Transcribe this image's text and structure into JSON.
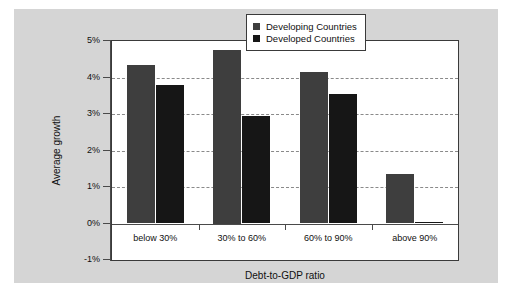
{
  "chart_data": {
    "type": "bar",
    "title": "",
    "xlabel": "Debt-to-GDP ratio",
    "ylabel": "Average growth",
    "categories": [
      "below 30%",
      "30% to 60%",
      "60% to 90%",
      "above 90%"
    ],
    "series": [
      {
        "name": "Developing Countries",
        "color": "#3e3e3e",
        "values": [
          4.35,
          4.75,
          4.15,
          1.35
        ]
      },
      {
        "name": "Developed Countries",
        "color": "#161616",
        "values": [
          3.8,
          2.95,
          3.55,
          0.05
        ]
      }
    ],
    "ylim": [
      -1,
      5
    ],
    "ytick_labels": [
      "5%",
      "4%",
      "3%",
      "2%",
      "1%",
      "0%",
      "-1%"
    ],
    "ytick_values": [
      5,
      4,
      3,
      2,
      1,
      0,
      -1
    ],
    "yunit": "%",
    "grid": "horizontal-dashed",
    "gridline_values": [
      4,
      3,
      2,
      1
    ],
    "legend_position": "top-right",
    "background_color": "#d5d5d5",
    "plot_background_color": "#ffffff"
  },
  "legend": {
    "entries": [
      {
        "label": "Developing Countries"
      },
      {
        "label": "Developed Countries"
      }
    ]
  }
}
